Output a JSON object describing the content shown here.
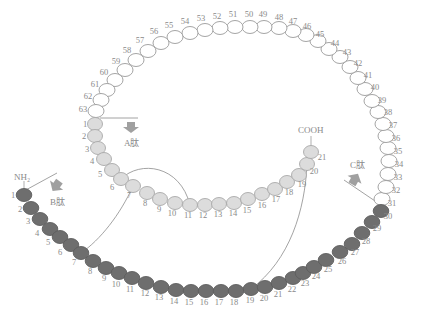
{
  "colors": {
    "ring_fill": "#ffffff",
    "ring_stroke": "#9a9a9a",
    "a_fill": "#dcdcdc",
    "a_stroke": "#a8a8a8",
    "b_fill": "#6e6e6e",
    "b_stroke": "#5e5e5e",
    "text": "#8a8a8a",
    "line": "#8c8c8c",
    "arrow_fill": "#9a9a9a"
  },
  "labels": {
    "a_peptide": "A肽",
    "b_peptide": "B肽",
    "c_peptide": "C肽",
    "nh2": "NH₂",
    "cooh": "COOH"
  },
  "ring_chain": [
    {
      "n": "31",
      "x": 382,
      "y": 199,
      "lx": 392,
      "ly": 206
    },
    {
      "n": "32",
      "x": 386,
      "y": 187,
      "lx": 396,
      "ly": 193
    },
    {
      "n": "33",
      "x": 388,
      "y": 174,
      "lx": 398,
      "ly": 180
    },
    {
      "n": "34",
      "x": 389,
      "y": 161,
      "lx": 399,
      "ly": 167
    },
    {
      "n": "35",
      "x": 388,
      "y": 148,
      "lx": 398,
      "ly": 154
    },
    {
      "n": "36",
      "x": 386,
      "y": 136,
      "lx": 396,
      "ly": 141
    },
    {
      "n": "37",
      "x": 383,
      "y": 124,
      "lx": 393,
      "ly": 128
    },
    {
      "n": "38",
      "x": 378,
      "y": 112,
      "lx": 388,
      "ly": 115
    },
    {
      "n": "39",
      "x": 372,
      "y": 101,
      "lx": 382,
      "ly": 103
    },
    {
      "n": "40",
      "x": 365,
      "y": 89,
      "lx": 375,
      "ly": 90
    },
    {
      "n": "41",
      "x": 358,
      "y": 78,
      "lx": 368,
      "ly": 78
    },
    {
      "n": "42",
      "x": 350,
      "y": 67,
      "lx": 358,
      "ly": 66
    },
    {
      "n": "43",
      "x": 340,
      "y": 57,
      "lx": 347,
      "ly": 55
    },
    {
      "n": "44",
      "x": 329,
      "y": 49,
      "lx": 335,
      "ly": 46
    },
    {
      "n": "45",
      "x": 318,
      "y": 41,
      "lx": 320,
      "ly": 37
    },
    {
      "n": "46",
      "x": 306,
      "y": 35,
      "lx": 307,
      "ly": 29
    },
    {
      "n": "47",
      "x": 293,
      "y": 31,
      "lx": 293,
      "ly": 24
    },
    {
      "n": "48",
      "x": 279,
      "y": 28,
      "lx": 279,
      "ly": 20
    },
    {
      "n": "49",
      "x": 264,
      "y": 27,
      "lx": 263,
      "ly": 17
    },
    {
      "n": "50",
      "x": 250,
      "y": 27,
      "lx": 249,
      "ly": 17
    },
    {
      "n": "51",
      "x": 235,
      "y": 27,
      "lx": 233,
      "ly": 17
    },
    {
      "n": "52",
      "x": 220,
      "y": 28,
      "lx": 217,
      "ly": 19
    },
    {
      "n": "53",
      "x": 205,
      "y": 30,
      "lx": 201,
      "ly": 21
    },
    {
      "n": "54",
      "x": 190,
      "y": 33,
      "lx": 185,
      "ly": 24
    },
    {
      "n": "55",
      "x": 175,
      "y": 37,
      "lx": 169,
      "ly": 28
    },
    {
      "n": "56",
      "x": 161,
      "y": 43,
      "lx": 154,
      "ly": 34
    },
    {
      "n": "57",
      "x": 148,
      "y": 51,
      "lx": 140,
      "ly": 43
    },
    {
      "n": "58",
      "x": 136,
      "y": 60,
      "lx": 127,
      "ly": 53
    },
    {
      "n": "59",
      "x": 125,
      "y": 70,
      "lx": 116,
      "ly": 64
    },
    {
      "n": "60",
      "x": 115,
      "y": 80,
      "lx": 104,
      "ly": 75
    },
    {
      "n": "61",
      "x": 107,
      "y": 90,
      "lx": 95,
      "ly": 87
    },
    {
      "n": "62",
      "x": 101,
      "y": 100,
      "lx": 88,
      "ly": 99
    },
    {
      "n": "63",
      "x": 96,
      "y": 111,
      "lx": 83,
      "ly": 112
    }
  ],
  "a_chain": [
    {
      "n": "1",
      "x": 95,
      "y": 124,
      "lx": 85,
      "ly": 127
    },
    {
      "n": "2",
      "x": 95,
      "y": 136,
      "lx": 84,
      "ly": 139
    },
    {
      "n": "3",
      "x": 98,
      "y": 148,
      "lx": 87,
      "ly": 152
    },
    {
      "n": "4",
      "x": 104,
      "y": 159,
      "lx": 92,
      "ly": 164
    },
    {
      "n": "5",
      "x": 112,
      "y": 170,
      "lx": 100,
      "ly": 177
    },
    {
      "n": "6",
      "x": 121,
      "y": 179,
      "lx": 112,
      "ly": 190
    },
    {
      "n": "7",
      "x": 133,
      "y": 186,
      "lx": 129,
      "ly": 198
    },
    {
      "n": "8",
      "x": 147,
      "y": 193,
      "lx": 145,
      "ly": 206
    },
    {
      "n": "9",
      "x": 160,
      "y": 199,
      "lx": 159,
      "ly": 212
    },
    {
      "n": "10",
      "x": 175,
      "y": 203,
      "lx": 172,
      "ly": 216
    },
    {
      "n": "11",
      "x": 190,
      "y": 205,
      "lx": 188,
      "ly": 218
    },
    {
      "n": "12",
      "x": 205,
      "y": 205,
      "lx": 203,
      "ly": 218
    },
    {
      "n": "13",
      "x": 219,
      "y": 204,
      "lx": 218,
      "ly": 217
    },
    {
      "n": "14",
      "x": 234,
      "y": 203,
      "lx": 233,
      "ly": 216
    },
    {
      "n": "15",
      "x": 248,
      "y": 199,
      "lx": 247,
      "ly": 213
    },
    {
      "n": "16",
      "x": 262,
      "y": 194,
      "lx": 262,
      "ly": 208
    },
    {
      "n": "17",
      "x": 275,
      "y": 189,
      "lx": 276,
      "ly": 202
    },
    {
      "n": "18",
      "x": 287,
      "y": 182,
      "lx": 289,
      "ly": 195
    },
    {
      "n": "19",
      "x": 299,
      "y": 175,
      "lx": 302,
      "ly": 187
    },
    {
      "n": "20",
      "x": 307,
      "y": 164,
      "lx": 314,
      "ly": 174
    },
    {
      "n": "21",
      "x": 311,
      "y": 152,
      "lx": 322,
      "ly": 160
    }
  ],
  "b_chain": [
    {
      "n": "1",
      "x": 24,
      "y": 195,
      "lx": 13,
      "ly": 198
    },
    {
      "n": "2",
      "x": 31,
      "y": 208,
      "lx": 20,
      "ly": 212
    },
    {
      "n": "3",
      "x": 40,
      "y": 219,
      "lx": 28,
      "ly": 224
    },
    {
      "n": "4",
      "x": 50,
      "y": 229,
      "lx": 37,
      "ly": 236
    },
    {
      "n": "5",
      "x": 60,
      "y": 237,
      "lx": 48,
      "ly": 245
    },
    {
      "n": "6",
      "x": 71,
      "y": 245,
      "lx": 60,
      "ly": 255
    },
    {
      "n": "7",
      "x": 81,
      "y": 253,
      "lx": 74,
      "ly": 265
    },
    {
      "n": "8",
      "x": 93,
      "y": 261,
      "lx": 90,
      "ly": 274
    },
    {
      "n": "9",
      "x": 106,
      "y": 268,
      "lx": 104,
      "ly": 281
    },
    {
      "n": "10",
      "x": 119,
      "y": 273,
      "lx": 116,
      "ly": 287
    },
    {
      "n": "11",
      "x": 132,
      "y": 278,
      "lx": 130,
      "ly": 292
    },
    {
      "n": "12",
      "x": 146,
      "y": 283,
      "lx": 145,
      "ly": 296
    },
    {
      "n": "13",
      "x": 161,
      "y": 287,
      "lx": 159,
      "ly": 300
    },
    {
      "n": "14",
      "x": 176,
      "y": 290,
      "lx": 174,
      "ly": 304
    },
    {
      "n": "15",
      "x": 191,
      "y": 291,
      "lx": 189,
      "ly": 305
    },
    {
      "n": "16",
      "x": 206,
      "y": 291,
      "lx": 204,
      "ly": 305
    },
    {
      "n": "17",
      "x": 221,
      "y": 291,
      "lx": 219,
      "ly": 305
    },
    {
      "n": "18",
      "x": 236,
      "y": 291,
      "lx": 234,
      "ly": 305
    },
    {
      "n": "19",
      "x": 251,
      "y": 289,
      "lx": 250,
      "ly": 303
    },
    {
      "n": "20",
      "x": 265,
      "y": 287,
      "lx": 264,
      "ly": 301
    },
    {
      "n": "21",
      "x": 279,
      "y": 283,
      "lx": 278,
      "ly": 297
    },
    {
      "n": "22",
      "x": 293,
      "y": 278,
      "lx": 292,
      "ly": 292
    },
    {
      "n": "23",
      "x": 303,
      "y": 273,
      "lx": 305,
      "ly": 286
    },
    {
      "n": "24",
      "x": 314,
      "y": 267,
      "lx": 316,
      "ly": 279
    },
    {
      "n": "25",
      "x": 326,
      "y": 260,
      "lx": 328,
      "ly": 272
    },
    {
      "n": "26",
      "x": 340,
      "y": 252,
      "lx": 342,
      "ly": 264
    },
    {
      "n": "27",
      "x": 352,
      "y": 244,
      "lx": 355,
      "ly": 255
    },
    {
      "n": "28",
      "x": 362,
      "y": 233,
      "lx": 366,
      "ly": 244
    },
    {
      "n": "29",
      "x": 372,
      "y": 222,
      "lx": 377,
      "ly": 231
    },
    {
      "n": "30",
      "x": 381,
      "y": 211,
      "lx": 388,
      "ly": 219
    }
  ]
}
